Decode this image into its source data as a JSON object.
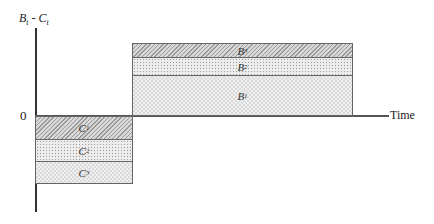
{
  "diagram": {
    "y_axis_label": {
      "main": "B",
      "sub1": "t",
      "sep": " - ",
      "main2": "C",
      "sub2": "t"
    },
    "x_axis_label": "Time",
    "origin_label": "0",
    "benefits": [
      {
        "label": "B",
        "sub": "3",
        "pattern": "hatch"
      },
      {
        "label": "B",
        "sub": "2",
        "pattern": "dots"
      },
      {
        "label": "B",
        "sub": "1",
        "pattern": "check"
      }
    ],
    "costs": [
      {
        "label": "C",
        "sub": "1",
        "pattern": "hatch"
      },
      {
        "label": "C",
        "sub": "2",
        "pattern": "dots"
      },
      {
        "label": "C",
        "sub": "3",
        "pattern": "check"
      }
    ]
  }
}
